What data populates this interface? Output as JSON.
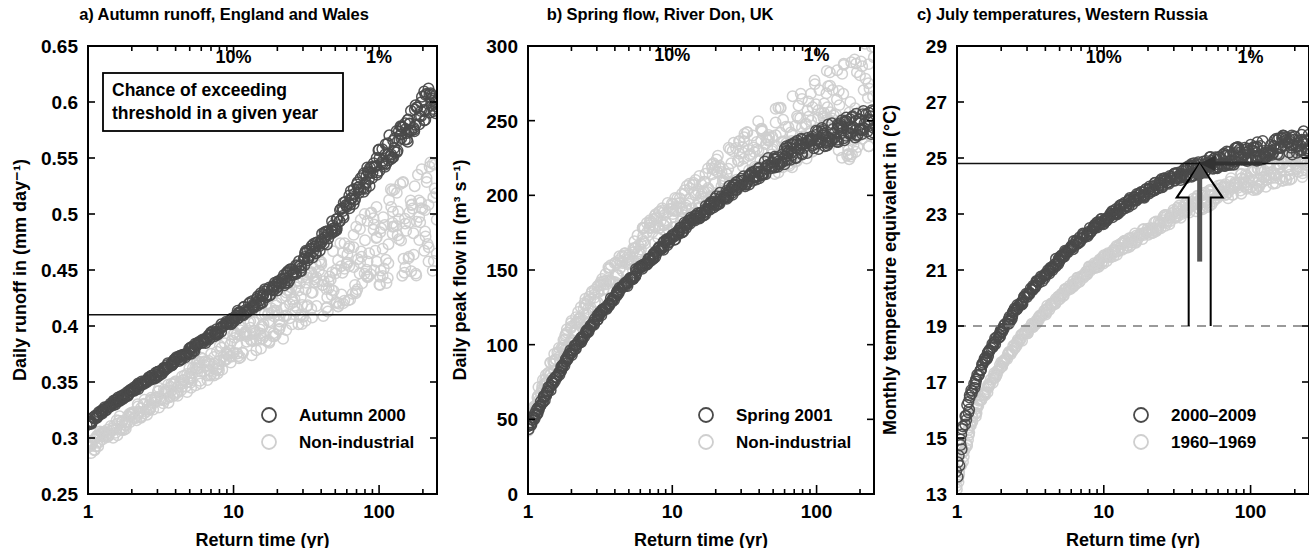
{
  "figure": {
    "xaxis_label": "Return time (yr)",
    "x_ticks": [
      "1",
      "10",
      "100"
    ],
    "annotation_10pct": "10%",
    "annotation_1pct": "1%",
    "colors": {
      "dark_series": "#4a4a4a",
      "light_series": "#cfcfcf",
      "axis": "#000000",
      "threshold_line": "#111111",
      "dashed_line": "#7a7a7a",
      "background": "#ffffff"
    }
  },
  "panels": [
    {
      "id": "a",
      "title": "a) Autumn runoff, England and Wales",
      "ylabel": "Daily runoff in (mm day⁻¹)",
      "y_ticks": [
        "0.25",
        "0.3",
        "0.35",
        "0.4",
        "0.45",
        "0.5",
        "0.55",
        "0.6",
        "0.65"
      ],
      "callout": {
        "line1": "Chance of exceeding",
        "line2": "threshold in a given year"
      },
      "legend": [
        {
          "label": "Autumn 2000",
          "color": "#4a4a4a"
        },
        {
          "label": "Non-industrial",
          "color": "#cfcfcf"
        }
      ]
    },
    {
      "id": "b",
      "title": "b) Spring flow, River Don, UK",
      "ylabel": "Daily peak flow in (m³ s⁻¹)",
      "y_ticks": [
        "0",
        "50",
        "100",
        "150",
        "200",
        "250",
        "300"
      ],
      "legend": [
        {
          "label": "Spring 2001",
          "color": "#4a4a4a"
        },
        {
          "label": "Non-industrial",
          "color": "#cfcfcf"
        }
      ]
    },
    {
      "id": "c",
      "title": "c) July temperatures, Western Russia",
      "ylabel": "Monthly temperature equivalent in (°C)",
      "y_ticks": [
        "13",
        "15",
        "17",
        "19",
        "21",
        "23",
        "25",
        "27",
        "29"
      ],
      "legend": [
        {
          "label": "2000–2009",
          "color": "#4a4a4a"
        },
        {
          "label": "1960–1969",
          "color": "#cfcfcf"
        }
      ]
    }
  ],
  "chart_data": [
    {
      "type": "scatter",
      "panel": "a",
      "title": "a) Autumn runoff, England and Wales",
      "xlabel": "Return time (yr)",
      "ylabel": "Daily runoff in (mm day⁻¹)",
      "xscale": "log",
      "xlim": [
        1,
        250
      ],
      "ylim": [
        0.25,
        0.65
      ],
      "x_ticks": [
        1,
        10,
        100
      ],
      "y_ticks": [
        0.25,
        0.3,
        0.35,
        0.4,
        0.45,
        0.5,
        0.55,
        0.6,
        0.65
      ],
      "grid": false,
      "legend_position": "bottom-right",
      "threshold_line": {
        "y": 0.41,
        "style": "solid",
        "label": ""
      },
      "annotations": [
        {
          "text": "10%",
          "x": 10,
          "y": 0.635
        },
        {
          "text": "1%",
          "x": 100,
          "y": 0.635
        },
        {
          "text": "Chance of exceeding threshold in a given year",
          "x": 3.0,
          "y": 0.595
        }
      ],
      "series": [
        {
          "name": "Autumn 2000",
          "color": "#4a4a4a",
          "marker": "open-circle",
          "x": [
            1.0,
            1.3,
            1.7,
            2.2,
            2.9,
            3.8,
            5.0,
            6.5,
            8.5,
            11,
            14.5,
            19,
            25,
            32,
            42,
            55,
            72,
            95,
            125,
            160,
            200,
            230
          ],
          "y": [
            0.313,
            0.325,
            0.336,
            0.346,
            0.356,
            0.367,
            0.377,
            0.388,
            0.399,
            0.41,
            0.422,
            0.434,
            0.447,
            0.461,
            0.478,
            0.5,
            0.523,
            0.543,
            0.562,
            0.578,
            0.594,
            0.603
          ],
          "spread": 0.008
        },
        {
          "name": "Non-industrial",
          "color": "#cfcfcf",
          "marker": "open-circle",
          "x": [
            1.0,
            1.3,
            1.7,
            2.2,
            2.9,
            3.8,
            5.0,
            6.5,
            8.5,
            11,
            14.5,
            19,
            25,
            32,
            42,
            55,
            72,
            95,
            125,
            160,
            200,
            230
          ],
          "y": [
            0.29,
            0.302,
            0.313,
            0.323,
            0.333,
            0.343,
            0.353,
            0.363,
            0.373,
            0.383,
            0.393,
            0.403,
            0.414,
            0.425,
            0.437,
            0.449,
            0.461,
            0.472,
            0.482,
            0.49,
            0.497,
            0.5
          ],
          "spread": 0.03
        }
      ]
    },
    {
      "type": "scatter",
      "panel": "b",
      "title": "b) Spring flow, River Don, UK",
      "xlabel": "Return time (yr)",
      "ylabel": "Daily peak flow in (m³ s⁻¹)",
      "xscale": "log",
      "xlim": [
        1,
        250
      ],
      "ylim": [
        0,
        300
      ],
      "x_ticks": [
        1,
        10,
        100
      ],
      "y_ticks": [
        0,
        50,
        100,
        150,
        200,
        250,
        300
      ],
      "grid": false,
      "legend_position": "bottom-right",
      "annotations": [
        {
          "text": "10%",
          "x": 10,
          "y": 290
        },
        {
          "text": "1%",
          "x": 100,
          "y": 290
        }
      ],
      "series": [
        {
          "name": "Spring 2001",
          "color": "#4a4a4a",
          "marker": "open-circle",
          "x": [
            1.0,
            1.1,
            1.3,
            1.6,
            2.0,
            2.6,
            3.4,
            4.5,
            6.0,
            8.0,
            11,
            15,
            20,
            27,
            36,
            48,
            64,
            85,
            115,
            155,
            205,
            240
          ],
          "y": [
            44,
            52,
            65,
            80,
            95,
            110,
            124,
            138,
            151,
            163,
            175,
            186,
            196,
            205,
            213,
            221,
            228,
            234,
            240,
            244,
            248,
            250
          ],
          "spread": 5
        },
        {
          "name": "Non-industrial",
          "color": "#cfcfcf",
          "marker": "open-circle",
          "x": [
            1.0,
            1.1,
            1.3,
            1.6,
            2.0,
            2.6,
            3.4,
            4.5,
            6.0,
            8.0,
            11,
            15,
            20,
            27,
            36,
            48,
            64,
            85,
            115,
            155,
            205,
            240
          ],
          "y": [
            46,
            58,
            75,
            93,
            110,
            126,
            141,
            155,
            168,
            180,
            191,
            201,
            210,
            219,
            227,
            234,
            241,
            247,
            253,
            258,
            263,
            266
          ],
          "spread": 22
        }
      ]
    },
    {
      "type": "scatter",
      "panel": "c",
      "title": "c) July temperatures, Western Russia",
      "xlabel": "Return time (yr)",
      "ylabel": "Monthly temperature equivalent in (°C)",
      "xscale": "log",
      "xlim": [
        1,
        250
      ],
      "ylim": [
        13,
        29
      ],
      "x_ticks": [
        1,
        10,
        100
      ],
      "y_ticks": [
        13,
        15,
        17,
        19,
        21,
        23,
        25,
        27,
        29
      ],
      "grid": false,
      "legend_position": "bottom-right",
      "threshold_line": {
        "y": 24.8,
        "style": "solid",
        "label": ""
      },
      "reference_line": {
        "y": 19.0,
        "style": "dashed",
        "label": ""
      },
      "arrows": [
        {
          "name": "hollow-up-arrow",
          "x": 45,
          "y_from": 19.0,
          "y_to": 24.8,
          "style": "outline"
        },
        {
          "name": "solid-up-arrow",
          "x": 45,
          "y_from": 21.3,
          "y_to": 24.8,
          "style": "filled"
        },
        {
          "name": "left-arrow",
          "x_from": 120,
          "x_to": 45,
          "y": 24.8,
          "style": "filled"
        }
      ],
      "annotations": [
        {
          "text": "10%",
          "x": 10,
          "y": 28.4
        },
        {
          "text": "1%",
          "x": 100,
          "y": 28.4
        }
      ],
      "series": [
        {
          "name": "2000–2009",
          "color": "#4a4a4a",
          "marker": "open-circle",
          "x": [
            1.0,
            1.1,
            1.25,
            1.5,
            1.9,
            2.4,
            3.1,
            4.1,
            5.4,
            7.2,
            9.6,
            13,
            17,
            23,
            31,
            42,
            56,
            75,
            100,
            135,
            180,
            240
          ],
          "y": [
            13.6,
            15.3,
            16.6,
            17.7,
            18.6,
            19.4,
            20.2,
            20.9,
            21.6,
            22.2,
            22.7,
            23.2,
            23.6,
            24.0,
            24.3,
            24.6,
            24.85,
            25.05,
            25.2,
            25.35,
            25.5,
            25.6
          ],
          "spread": 0.25
        },
        {
          "name": "1960–1969",
          "color": "#cfcfcf",
          "marker": "open-circle",
          "x": [
            1.0,
            1.1,
            1.25,
            1.5,
            1.9,
            2.4,
            3.1,
            4.1,
            5.4,
            7.2,
            9.6,
            13,
            17,
            23,
            31,
            42,
            56,
            75,
            100,
            135,
            180,
            240
          ],
          "y": [
            13.1,
            14.4,
            15.5,
            16.5,
            17.4,
            18.2,
            18.9,
            19.6,
            20.2,
            20.8,
            21.3,
            21.8,
            22.2,
            22.6,
            23.0,
            23.35,
            23.65,
            23.95,
            24.2,
            24.45,
            24.7,
            24.9
          ],
          "spread": 0.3
        }
      ]
    }
  ]
}
